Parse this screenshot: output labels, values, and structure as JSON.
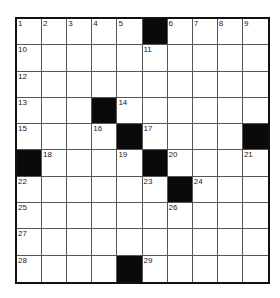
{
  "puzzle": {
    "rows": 10,
    "cols": 10,
    "colors": {
      "block": "#0a0a0a",
      "cell": "#ffffff",
      "line": "#555555",
      "border": "#111111"
    },
    "grid": [
      [
        "1",
        "2",
        "3",
        "4",
        "5",
        "#",
        "6",
        "7",
        "8",
        "9"
      ],
      [
        "10",
        "",
        "",
        "",
        "",
        "11",
        "",
        "",
        "",
        ""
      ],
      [
        "12",
        "",
        "",
        "",
        "",
        "",
        "",
        "",
        "",
        ""
      ],
      [
        "13",
        "",
        "",
        "#",
        "14",
        "",
        "",
        "",
        "",
        ""
      ],
      [
        "15",
        "",
        "",
        "16",
        "#",
        "17",
        "",
        "",
        "",
        "#"
      ],
      [
        "#",
        "18",
        "",
        "",
        "19",
        "#",
        "20",
        "",
        "",
        "21"
      ],
      [
        "22",
        "",
        "",
        "",
        "",
        "23",
        "#",
        "24",
        "",
        ""
      ],
      [
        "25",
        "",
        "",
        "",
        "",
        "",
        "26",
        "",
        "",
        ""
      ],
      [
        "27",
        "",
        "",
        "",
        "",
        "",
        "",
        "",
        "",
        ""
      ],
      [
        "28",
        "",
        "",
        "",
        "#",
        "29",
        "",
        "",
        "",
        ""
      ]
    ]
  }
}
